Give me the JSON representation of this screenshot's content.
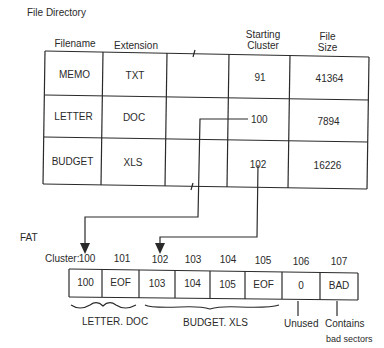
{
  "titles": {
    "directory": "File Directory",
    "fat": "FAT"
  },
  "directory": {
    "headers": {
      "filename": "Filename",
      "extension": "Extension",
      "cluster_line1": "Starting",
      "cluster_line2": "Cluster",
      "size_line1": "File",
      "size_line2": "Size"
    },
    "rows": [
      {
        "filename": "MEMO",
        "extension": "TXT",
        "cluster": "91",
        "size": "41364"
      },
      {
        "filename": "LETTER",
        "extension": "DOC",
        "cluster": "100",
        "size": "7894"
      },
      {
        "filename": "BUDGET",
        "extension": "XLS",
        "cluster": "102",
        "size": "16226"
      }
    ]
  },
  "fat": {
    "cluster_label": "Cluster:",
    "clusters": [
      {
        "number": "100",
        "value": "100"
      },
      {
        "number": "101",
        "value": "EOF"
      },
      {
        "number": "102",
        "value": "103"
      },
      {
        "number": "103",
        "value": "104"
      },
      {
        "number": "104",
        "value": "105"
      },
      {
        "number": "105",
        "value": "EOF"
      },
      {
        "number": "106",
        "value": "0"
      },
      {
        "number": "107",
        "value": "BAD"
      }
    ],
    "annotations": {
      "letter": "LETTER. DOC",
      "budget": "BUDGET. XLS",
      "unused": "Unused",
      "bad_line1": "Contains",
      "bad_line2": "bad sectors"
    }
  }
}
